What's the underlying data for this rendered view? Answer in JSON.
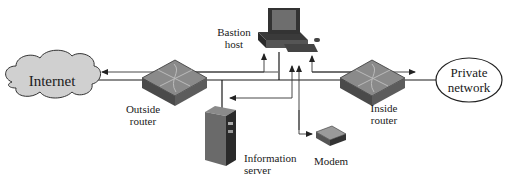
{
  "diagram": {
    "type": "network-topology",
    "nodes": {
      "internet": {
        "label": "Internet",
        "shape": "cloud"
      },
      "outside_router": {
        "label_line1": "Outside",
        "label_line2": "router",
        "shape": "router"
      },
      "bastion_host": {
        "label_line1": "Bastion",
        "label_line2": "host",
        "shape": "workstation"
      },
      "information_server": {
        "label_line1": "Information",
        "label_line2": "server",
        "shape": "server-tower"
      },
      "modem": {
        "label": "Modem",
        "shape": "modem"
      },
      "inside_router": {
        "label_line1": "Inside",
        "label_line2": "router",
        "shape": "router"
      },
      "private_network": {
        "label_line1": "Private",
        "label_line2": "network",
        "shape": "ellipse"
      }
    },
    "edges": [
      {
        "from": "internet",
        "to": "outside_router"
      },
      {
        "from": "outside_router",
        "to": "inside_router",
        "via": "backbone"
      },
      {
        "from": "backbone",
        "to": "bastion_host"
      },
      {
        "from": "backbone",
        "to": "information_server"
      },
      {
        "from": "inside_router",
        "to": "private_network"
      }
    ],
    "flows": [
      {
        "from": "bastion_host",
        "to": "internet",
        "direction": "left"
      },
      {
        "from": "outside_router",
        "to": "bastion_host",
        "direction": "up"
      },
      {
        "from": "bastion_host",
        "to": "information_server",
        "direction": "left"
      },
      {
        "from": "bastion_host",
        "to": "modem",
        "direction": "down"
      },
      {
        "from": "inside_router",
        "to": "bastion_host",
        "direction": "up"
      },
      {
        "from": "bastion_host",
        "to": "private_network",
        "direction": "right"
      }
    ],
    "colors": {
      "device_top": "#8a8a8a",
      "device_side": "#4a4a4a",
      "cloud_fill": "#d0d0d0",
      "line": "#1a1a1a"
    }
  }
}
